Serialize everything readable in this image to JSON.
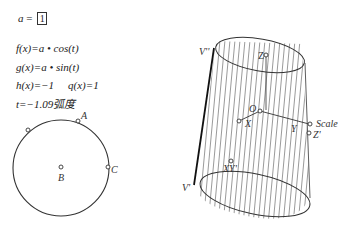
{
  "parameter": {
    "name": "a",
    "eq": " = ",
    "value": "1"
  },
  "functions": [
    {
      "id": "f",
      "text": "f(x)=a • cos(t)"
    },
    {
      "id": "g",
      "text": "g(x)=a • sin(t)"
    },
    {
      "id": "h",
      "text": "h(x)=−1"
    },
    {
      "id": "q",
      "text": "q(x)=1"
    }
  ],
  "t_value": "t=−1.09弧度",
  "circle": {
    "labels": {
      "A": "A",
      "B": "B",
      "C": "C"
    }
  },
  "cylinder": {
    "labels": {
      "Vpp": "V''",
      "Vp": "V'",
      "Z": "Z",
      "O": "O",
      "X": "X",
      "Y": "Y",
      "Scale": "Scale",
      "Zp": "Z'",
      "XYp": "XY'"
    }
  },
  "colors": {
    "stroke": "#333333",
    "hatch": "#555555",
    "background": "#ffffff"
  }
}
